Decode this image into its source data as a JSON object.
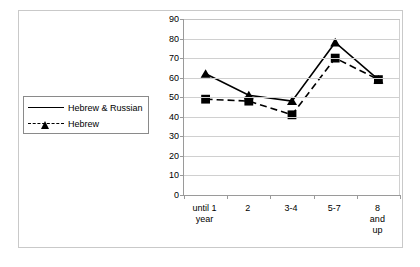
{
  "chart_data": {
    "type": "line",
    "title": "",
    "xlabel": "",
    "ylabel": "",
    "categories": [
      "until 1\nyear",
      "2",
      "3-4",
      "5-7",
      "8 and up"
    ],
    "ylim": [
      0,
      90
    ],
    "yticks": [
      0,
      10,
      20,
      30,
      40,
      50,
      60,
      70,
      80,
      90
    ],
    "grid": true,
    "legend_position": "left-outside",
    "series": [
      {
        "name": "Hebrew & Russian",
        "values": [
          62,
          51,
          48,
          78,
          59
        ],
        "marker": "triangle",
        "line_style": "solid",
        "color": "#000000"
      },
      {
        "name": "Hebrew",
        "values": [
          49,
          48,
          41,
          70,
          59
        ],
        "marker": "square",
        "line_style": "dashed",
        "color": "#000000"
      }
    ]
  },
  "legend": {
    "items": [
      {
        "label": "Hebrew & Russian",
        "marker": "triangle-marker",
        "line": "solid"
      },
      {
        "label": "Hebrew",
        "marker": "square-marker",
        "line": "dashed"
      }
    ]
  },
  "axis": {
    "y_tick_labels": [
      "90",
      "80",
      "70",
      "60",
      "50",
      "40",
      "30",
      "20",
      "10",
      "0"
    ],
    "x_tick_labels": [
      "until 1\nyear",
      "2",
      "3-4",
      "5-7",
      "8 and up"
    ]
  }
}
